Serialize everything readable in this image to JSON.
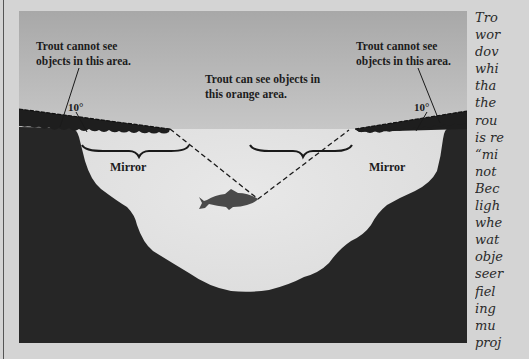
{
  "figure": {
    "labels": {
      "left_blind_zone": [
        "Trout cannot see",
        "objects in this area."
      ],
      "right_blind_zone": [
        "Trout cannot see",
        "objects in this area."
      ],
      "visible_zone": [
        "Trout can see objects in",
        "this orange area."
      ],
      "left_angle": "10°",
      "right_angle": "10°",
      "left_mirror": "Mirror",
      "right_mirror": "Mirror"
    },
    "icons": {
      "fish": "trout-silhouette-icon"
    },
    "colors": {
      "sky_top": "#a9a9a9",
      "sky_bottom": "#dedede",
      "water": "#e2e2e2",
      "ground": "#262626",
      "outer_bg": "#d4d4d4"
    }
  },
  "side_text": {
    "lines": [
      "Tro",
      "wor",
      "dov",
      "whi",
      "tha",
      "the",
      "rou",
      "is re",
      "“mi",
      "not",
      "Bec",
      "ligh",
      "whe",
      "wat",
      "obje",
      "seer",
      "fiel",
      "ing",
      "mu",
      "proj"
    ]
  }
}
